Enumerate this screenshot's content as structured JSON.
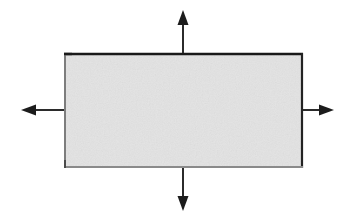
{
  "figure": {
    "title": "Rectangle with four outward expansion arrows",
    "canvas": {
      "width": 356,
      "height": 220,
      "background_color": "#ffffff"
    },
    "body": {
      "shape": "rectangle",
      "label": "expanding-body",
      "x": 64,
      "y": 53,
      "width": 239,
      "height": 115,
      "fill_color": "#e3e3e3",
      "fill_texture": "fine-gray-noise",
      "border_width": 2,
      "border_color_top": "#1a1a1a",
      "border_color_right": "#232323",
      "border_color_bottom": "#8a8a8a",
      "border_color_left": "#7d7d7d",
      "center_x": 183,
      "center_y": 110
    },
    "arrows": [
      {
        "name": "arrow-up",
        "direction": "up",
        "stroke_color": "#2b2b2b",
        "stroke_width": 2,
        "tail_x": 183,
        "tail_y": 53,
        "tip_x": 183,
        "tip_y": 10,
        "length": 43,
        "head_width": 11,
        "head_length": 15
      },
      {
        "name": "arrow-right",
        "direction": "right",
        "stroke_color": "#2b2b2b",
        "stroke_width": 2,
        "tail_x": 303,
        "tail_y": 110,
        "tip_x": 334,
        "tip_y": 110,
        "length": 31,
        "head_width": 11,
        "head_length": 15
      },
      {
        "name": "arrow-down",
        "direction": "down",
        "stroke_color": "#2b2b2b",
        "stroke_width": 2,
        "tail_x": 183,
        "tail_y": 168,
        "tip_x": 183,
        "tip_y": 211,
        "length": 43,
        "head_width": 11,
        "head_length": 15
      },
      {
        "name": "arrow-left",
        "direction": "left",
        "stroke_color": "#2b2b2b",
        "stroke_width": 2,
        "tail_x": 64,
        "tail_y": 110,
        "tip_x": 21,
        "tip_y": 110,
        "length": 43,
        "head_width": 11,
        "head_length": 15
      }
    ],
    "labels": []
  }
}
